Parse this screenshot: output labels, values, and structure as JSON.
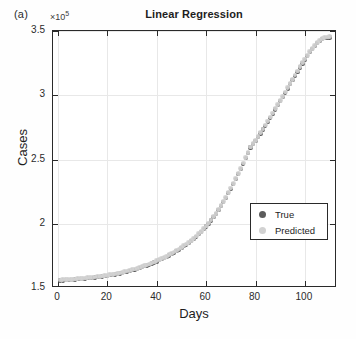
{
  "figure": {
    "panel_label": "(a)",
    "title": "Linear Regression",
    "exponent_label": "10",
    "exponent_power": "5",
    "exponent_prefix": "×"
  },
  "axes": {
    "xlabel": "Days",
    "ylabel": "Cases",
    "xticklabels": [
      "0",
      "20",
      "40",
      "60",
      "80",
      "100"
    ],
    "yticklabels": [
      "3.5",
      "3",
      "2.5",
      "2",
      "1.5"
    ]
  },
  "legend": {
    "items": [
      {
        "label": "True",
        "color": "#5c5c5c",
        "marker": "circle"
      },
      {
        "label": "Predicted",
        "color": "#d2d2d2",
        "marker": "circle"
      }
    ]
  },
  "chart_data": {
    "type": "scatter",
    "title": "Linear Regression",
    "subtitle": "(a)",
    "xlabel": "Days",
    "ylabel": "Cases",
    "y_exponent": 100000,
    "y_exponent_label": "×10^5",
    "xlim": [
      -2,
      113
    ],
    "ylim": [
      1.5,
      3.5
    ],
    "xticks": [
      0,
      20,
      40,
      60,
      80,
      100
    ],
    "yticks": [
      1.5,
      2,
      2.5,
      3,
      3.5
    ],
    "grid": true,
    "legend_position": "lower right",
    "series": [
      {
        "name": "True",
        "color": "#5c5c5c",
        "marker": "circle",
        "x": [
          1,
          2,
          3,
          4,
          5,
          6,
          7,
          8,
          9,
          10,
          11,
          12,
          13,
          14,
          15,
          16,
          17,
          18,
          19,
          20,
          21,
          22,
          23,
          24,
          25,
          26,
          27,
          28,
          29,
          30,
          31,
          32,
          33,
          34,
          35,
          36,
          37,
          38,
          39,
          40,
          41,
          42,
          43,
          44,
          45,
          46,
          47,
          48,
          49,
          50,
          51,
          52,
          53,
          54,
          55,
          56,
          57,
          58,
          59,
          60,
          61,
          62,
          63,
          64,
          65,
          66,
          67,
          68,
          69,
          70,
          71,
          72,
          73,
          74,
          75,
          76,
          77,
          78,
          79,
          80,
          81,
          82,
          83,
          84,
          85,
          86,
          87,
          88,
          89,
          90,
          91,
          92,
          93,
          94,
          95,
          96,
          97,
          98,
          99,
          100,
          101,
          102,
          103,
          104,
          105,
          106,
          107,
          108,
          109,
          110
        ],
        "y": [
          155800,
          155900,
          156000,
          156150,
          156300,
          156450,
          156600,
          156750,
          156900,
          157100,
          157300,
          157500,
          157700,
          157900,
          158150,
          158400,
          158650,
          158900,
          159200,
          159500,
          159800,
          160150,
          160500,
          160900,
          161300,
          161750,
          162200,
          162700,
          163200,
          163750,
          164300,
          164900,
          165500,
          166150,
          166800,
          167500,
          168200,
          169000,
          169800,
          170650,
          171500,
          172400,
          173350,
          174300,
          175350,
          176400,
          177500,
          178650,
          179850,
          181100,
          182400,
          183750,
          185200,
          186700,
          188300,
          190000,
          191800,
          193700,
          195700,
          197800,
          200100,
          202500,
          205100,
          207800,
          210700,
          213700,
          216900,
          220200,
          223700,
          227300,
          231000,
          234800,
          238700,
          242700,
          246800,
          250900,
          255100,
          259300,
          261800,
          264500,
          267400,
          270300,
          273300,
          276300,
          279400,
          282500,
          285700,
          288900,
          292100,
          295400,
          298700,
          302000,
          305300,
          308600,
          311900,
          315200,
          318400,
          321600,
          324700,
          327700,
          330600,
          333400,
          336000,
          338400,
          340500,
          342200,
          343500,
          344300,
          344800,
          345000
        ]
      },
      {
        "name": "Predicted",
        "color": "#d2d2d2",
        "marker": "circle",
        "x": [
          1,
          2,
          3,
          4,
          5,
          6,
          7,
          8,
          9,
          10,
          11,
          12,
          13,
          14,
          15,
          16,
          17,
          18,
          19,
          20,
          21,
          22,
          23,
          24,
          25,
          26,
          27,
          28,
          29,
          30,
          31,
          32,
          33,
          34,
          35,
          36,
          37,
          38,
          39,
          40,
          41,
          42,
          43,
          44,
          45,
          46,
          47,
          48,
          49,
          50,
          51,
          52,
          53,
          54,
          55,
          56,
          57,
          58,
          59,
          60,
          61,
          62,
          63,
          64,
          65,
          66,
          67,
          68,
          69,
          70,
          71,
          72,
          73,
          74,
          75,
          76,
          77,
          78,
          79,
          80,
          81,
          82,
          83,
          84,
          85,
          86,
          87,
          88,
          89,
          90,
          91,
          92,
          93,
          94,
          95,
          96,
          97,
          98,
          99,
          100,
          101,
          102,
          103,
          104,
          105,
          106,
          107,
          108,
          109,
          110
        ],
        "y": [
          156300,
          156400,
          156500,
          156600,
          156750,
          156900,
          157050,
          157200,
          157350,
          157550,
          157750,
          157950,
          158150,
          158350,
          158600,
          158850,
          159100,
          159350,
          159650,
          159950,
          160250,
          160600,
          160950,
          161350,
          161750,
          162200,
          162650,
          163150,
          163650,
          164200,
          164750,
          165350,
          165950,
          166600,
          167250,
          167950,
          168650,
          169450,
          170250,
          171100,
          171950,
          172850,
          173800,
          174750,
          175800,
          176850,
          177950,
          179100,
          180300,
          181550,
          182850,
          184200,
          185650,
          187150,
          188750,
          190450,
          192250,
          194150,
          196150,
          198250,
          200550,
          202950,
          205550,
          208250,
          211150,
          214150,
          217350,
          220650,
          224150,
          227750,
          231450,
          235250,
          239150,
          243150,
          247250,
          251350,
          255550,
          259750,
          262300,
          265000,
          267900,
          270800,
          273800,
          276800,
          279900,
          283000,
          286200,
          289400,
          292600,
          295900,
          299200,
          302500,
          305800,
          309100,
          312400,
          315700,
          318900,
          322100,
          325200,
          328200,
          331100,
          333900,
          336500,
          338900,
          341000,
          342700,
          344000,
          344800,
          345300,
          345500
        ]
      }
    ],
    "annotations": [
      "Both series overlap almost perfectly; exponential-shaped growth curve",
      "Flat plateau near 1.56e5 for days 0-45, inflection near day 65-70",
      "Curve saturates toward 3.45e5 at day 110"
    ]
  }
}
